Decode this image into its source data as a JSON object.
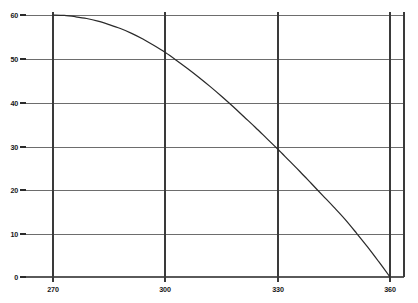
{
  "chart_data": {
    "type": "line",
    "title": "",
    "subtitle": "",
    "xlabel": "",
    "ylabel": "",
    "xlim": [
      265,
      365
    ],
    "ylim": [
      0,
      60
    ],
    "xticks": [
      270,
      300,
      330,
      360
    ],
    "xtick_labels": [
      "270",
      "300",
      "330",
      "360"
    ],
    "yticks": [
      0,
      10,
      20,
      30,
      40,
      50,
      60
    ],
    "ytick_labels": [
      "0",
      "10",
      "20",
      "30",
      "40",
      "50",
      "60"
    ],
    "grid": true,
    "grid_axes": "both",
    "legend": null,
    "legend_position": "none",
    "annotations": [],
    "series": [
      {
        "name": "curve",
        "color": "#2a2a2a",
        "x": [
          270,
          273,
          276,
          279,
          282,
          285,
          288,
          291,
          294,
          297,
          300,
          303,
          306,
          309,
          312,
          315,
          318,
          321,
          324,
          327,
          330,
          333,
          336,
          339,
          342,
          345,
          348,
          351,
          354,
          357,
          360
        ],
        "y": [
          60.0,
          59.9,
          59.6,
          59.2,
          58.6,
          57.8,
          56.9,
          55.8,
          54.5,
          53.0,
          51.4,
          49.6,
          47.7,
          45.7,
          43.6,
          41.4,
          39.1,
          36.7,
          34.3,
          31.8,
          29.3,
          26.7,
          24.1,
          21.4,
          18.7,
          16.0,
          13.2,
          10.1,
          6.9,
          3.5,
          0.0
        ]
      }
    ],
    "markers": [
      {
        "x": 270,
        "y": 60,
        "note": "curve start, tangent to y=60"
      },
      {
        "x": 300,
        "y": 50,
        "note": "crosses gridline intersection"
      },
      {
        "x": 330,
        "y": 30,
        "note": "crosses gridline intersection"
      },
      {
        "x": 360,
        "y": 0,
        "note": "curve end at origin-right baseline"
      }
    ]
  },
  "style": {
    "grid_color": "#6d6d6d",
    "axis_color": "#3a3a3a",
    "curve_color": "#2a2a2a",
    "background": "#ffffff",
    "tick_text_color": "#161616"
  }
}
